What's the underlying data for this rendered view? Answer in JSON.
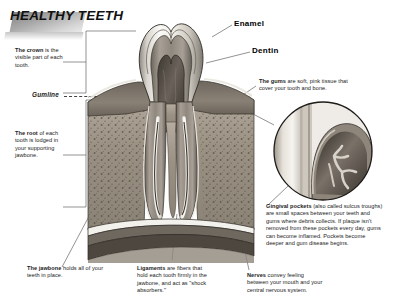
{
  "title": "HEALTHY TEETH",
  "labels": {
    "enamel": "Enamel",
    "dentin": "Dentin",
    "gumline": "Gumline"
  },
  "notes": {
    "crown": {
      "lead": "The crown",
      "rest": " is the visible part of each tooth."
    },
    "root": {
      "lead": "The root",
      "rest": " of each tooth is lodged in your supporting jawbone."
    },
    "gums": {
      "lead": "The gums",
      "rest": " are soft, pink tissue that cover your tooth and bone."
    },
    "gingival_pockets": {
      "lead": "Gingival pockets",
      "rest": " (also called sulcus troughs) are small spaces between your teeth and gums where debris collects. If plaque isn't removed from these pockets every day, gums can become inflamed. Pockets become deeper and gum disease begins."
    },
    "jawbone": {
      "lead": "The jawbone",
      "rest": " holds all of your teeth in place."
    },
    "ligaments": {
      "lead": "Ligaments",
      "rest": " are fibers that hold each tooth firmly in the jawbone, and act as \"shock absorbers.\""
    },
    "nerves": {
      "lead": "Nerves",
      "rest": " convey feeling between your mouth and your central nervous system."
    }
  },
  "illustration": {
    "name": "tooth-cross-section",
    "inset_name": "gingival-pocket-magnifier",
    "colors": {
      "enamel": "#f2f0ec",
      "dentin": "#8d867c",
      "pulp": "#4a443d",
      "gum": "#7d7569",
      "bone": "#a39a8c",
      "outline": "#2b2b2b"
    }
  }
}
